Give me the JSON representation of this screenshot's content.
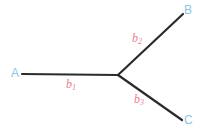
{
  "figure": {
    "type": "unrooted-phylogenetic-tree",
    "background_color": "#ffffff",
    "branch_color": "#2b2b2b",
    "taxon_label_color": "#8fc4e3",
    "branch_label_color": "#e8808f"
  },
  "taxa": [
    {
      "id": "A",
      "label": "A"
    },
    {
      "id": "B",
      "label": "B"
    },
    {
      "id": "C",
      "label": "C"
    }
  ],
  "branches": [
    {
      "id": "b1",
      "label": "b",
      "subscript": "1",
      "leads_to": "A"
    },
    {
      "id": "b2",
      "label": "b",
      "subscript": "2",
      "leads_to": "B"
    },
    {
      "id": "b3",
      "label": "b",
      "subscript": "3",
      "leads_to": "C"
    }
  ],
  "geometry": {
    "node": {
      "x": 118,
      "y": 75
    },
    "tip_a": {
      "x": 22,
      "y": 74
    },
    "tip_b": {
      "x": 183,
      "y": 14
    },
    "tip_c": {
      "x": 182,
      "y": 120
    },
    "stroke_width": 2.2
  }
}
